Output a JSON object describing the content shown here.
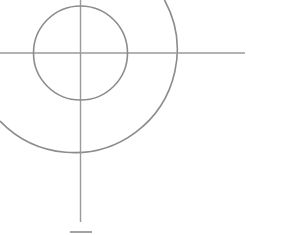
{
  "canvas": {
    "width": 305,
    "height": 235,
    "background_color": "#ffffff",
    "title": "Crosshair target diagram"
  },
  "style": {
    "line_color": "#8c8c8c",
    "line_color_soft": "#9a9a9a",
    "line_width": 1.6,
    "line_width_thin": 1.4
  },
  "geometry": {
    "center": {
      "x": 80.5,
      "y": 53
    },
    "inner_circle": {
      "label": "inner circle",
      "cx": 80.5,
      "cy": 53,
      "r": 47
    },
    "outer_arc": {
      "label": "outer arc",
      "cx": 80.5,
      "cy": 53,
      "r": 103,
      "path": "M 164.5 0 A 103 103 0 0 1 0 121",
      "start_angle_deg": -35,
      "end_angle_deg": 219,
      "sweep": "clockwise"
    },
    "horizontal_axis": {
      "label": "horizontal axis line",
      "x1": 0,
      "y1": 53,
      "x2": 245,
      "y2": 53
    },
    "vertical_axis": {
      "label": "vertical axis line",
      "x1": 80.5,
      "y1": 0,
      "x2": 80.5,
      "y2": 222
    },
    "bottom_tick": {
      "label": "bottom clipped mark",
      "x1": 70,
      "y1": 232,
      "x2": 92,
      "y2": 232
    }
  }
}
